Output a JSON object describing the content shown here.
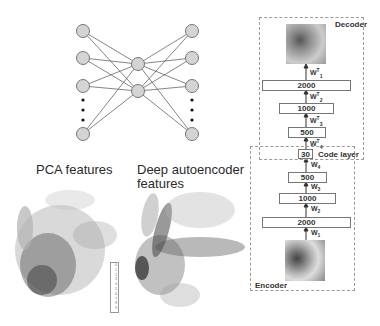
{
  "network": {
    "left_nodes": 4,
    "middle_nodes": 2,
    "right_nodes": 4,
    "ellipsis": "dots"
  },
  "scatter_titles": {
    "pca": "PCA features",
    "deep_line1": "Deep autoencoder",
    "deep_line2": "features"
  },
  "legend": {
    "entries": [
      "0",
      "1",
      "2",
      "3",
      "4",
      "5",
      "6",
      "7",
      "8",
      "9"
    ]
  },
  "autoencoder": {
    "decoder_label": "Decoder",
    "encoder_label": "Encoder",
    "code_layer_label": "Code layer",
    "code_size": "30",
    "decoder_layers": [
      {
        "size": "2000",
        "weight": "W",
        "sup": "T",
        "sub": "1"
      },
      {
        "size": "1000",
        "weight": "W",
        "sup": "T",
        "sub": "2"
      },
      {
        "size": "500",
        "weight": "W",
        "sup": "T",
        "sub": "3"
      }
    ],
    "decoder_top_weight": {
      "weight": "W",
      "sup": "T",
      "sub": "4"
    },
    "encoder_layers": [
      {
        "size": "500",
        "weight": "W",
        "sub": "4"
      },
      {
        "size": "1000",
        "weight": "W",
        "sub": "3"
      },
      {
        "size": "2000",
        "weight": "W",
        "sub": "2"
      }
    ],
    "encoder_bottom_weight": {
      "weight": "W",
      "sub": "1"
    }
  }
}
